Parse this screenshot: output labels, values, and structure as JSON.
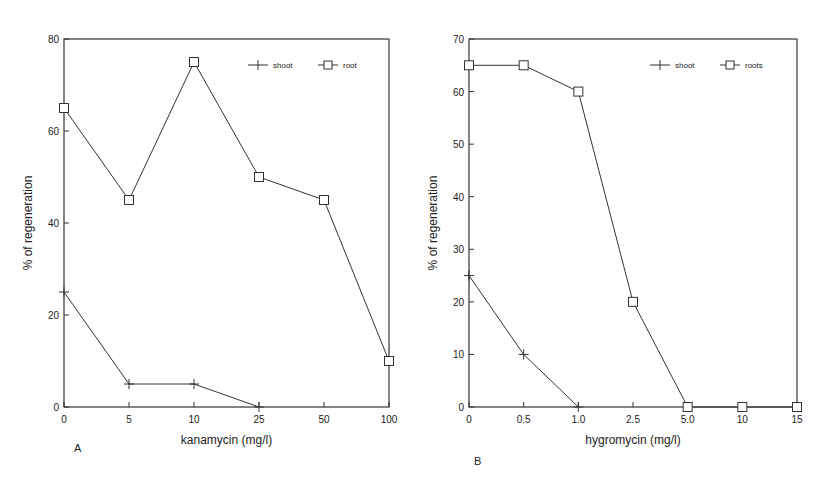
{
  "chart_data": [
    {
      "type": "line",
      "panel_label": "A",
      "title": "",
      "xlabel": "kanamycin (mg/l)",
      "ylabel": "% of regeneration",
      "categories": [
        "0",
        "5",
        "10",
        "25",
        "50",
        "100"
      ],
      "ylim": [
        0,
        80
      ],
      "yticks": [
        "0",
        "20",
        "40",
        "60",
        "80"
      ],
      "grid": false,
      "legend_position": "top-right inside",
      "series": [
        {
          "name": "shoot",
          "marker": "plus",
          "values": [
            25,
            5,
            5,
            0,
            null,
            null
          ]
        },
        {
          "name": "root",
          "marker": "square",
          "values": [
            65,
            45,
            75,
            50,
            45,
            10
          ]
        }
      ]
    },
    {
      "type": "line",
      "panel_label": "B",
      "title": "",
      "xlabel": "hygromycin (mg/l)",
      "ylabel": "% of regeneration",
      "categories": [
        "0",
        "0.5",
        "1.0",
        "2.5",
        "5.0",
        "10",
        "15"
      ],
      "ylim": [
        0,
        70
      ],
      "yticks": [
        "0",
        "10",
        "20",
        "30",
        "40",
        "50",
        "60",
        "70"
      ],
      "grid": false,
      "legend_position": "top-right inside",
      "series": [
        {
          "name": "shoot",
          "marker": "plus",
          "values": [
            25,
            10,
            0,
            null,
            null,
            null,
            null
          ]
        },
        {
          "name": "roots",
          "marker": "square",
          "values": [
            65,
            65,
            60,
            20,
            0,
            0,
            0
          ]
        }
      ]
    }
  ]
}
